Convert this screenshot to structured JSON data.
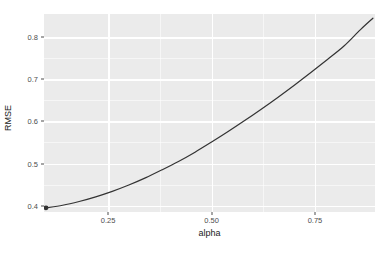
{
  "chart_data": {
    "type": "line",
    "title": "",
    "subtitle": "",
    "xlabel": "alpha",
    "ylabel": "RMSE",
    "xlim": [
      0.095,
      0.895
    ],
    "ylim": [
      0.385,
      0.855
    ],
    "grid": true,
    "legend": null,
    "x_ticks": [
      {
        "value": 0.25,
        "label": "0.25"
      },
      {
        "value": 0.5,
        "label": "0.50"
      },
      {
        "value": 0.75,
        "label": "0.75"
      }
    ],
    "y_ticks": [
      {
        "value": 0.4,
        "label": "0.4"
      },
      {
        "value": 0.5,
        "label": "0.5"
      },
      {
        "value": 0.6,
        "label": "0.6"
      },
      {
        "value": 0.7,
        "label": "0.7"
      },
      {
        "value": 0.8,
        "label": "0.8"
      }
    ],
    "x_minor_ticks": [
      0.375,
      0.625
    ],
    "y_minor_ticks": [
      0.45,
      0.55,
      0.65,
      0.75
    ],
    "series": [
      {
        "name": "RMSE vs alpha",
        "color": "#333333",
        "line_width": 1.2,
        "x": [
          0.1,
          0.14,
          0.18,
          0.22,
          0.26,
          0.3,
          0.34,
          0.38,
          0.42,
          0.46,
          0.5,
          0.54,
          0.58,
          0.62,
          0.66,
          0.7,
          0.74,
          0.78,
          0.82,
          0.86,
          0.89
        ],
        "y": [
          0.395,
          0.401,
          0.41,
          0.421,
          0.434,
          0.449,
          0.466,
          0.485,
          0.505,
          0.527,
          0.551,
          0.576,
          0.602,
          0.629,
          0.657,
          0.686,
          0.716,
          0.747,
          0.779,
          0.818,
          0.845
        ]
      }
    ],
    "points": [
      {
        "x": 0.1,
        "y": 0.395,
        "color": "#333333",
        "size": 2.4
      }
    ],
    "colors": {
      "panel_background": "#ebebeb",
      "grid_line": "#ffffff",
      "line": "#333333",
      "axis_text": "#4d4d4d",
      "axis_title": "#1a1a1a",
      "plot_background": "#ffffff"
    }
  }
}
